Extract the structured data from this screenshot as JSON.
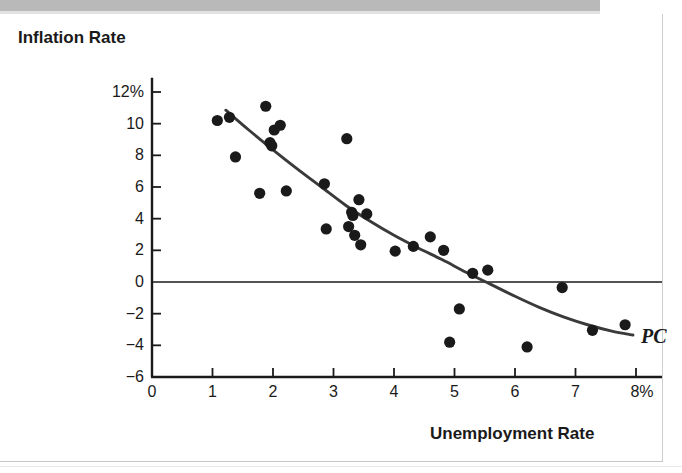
{
  "figure": {
    "y_axis_title": "Inflation Rate",
    "x_axis_title": "Unemployment Rate",
    "curve_label": "PC"
  },
  "chart_data": {
    "type": "scatter",
    "title": "",
    "xlabel": "Unemployment Rate",
    "ylabel": "Inflation Rate",
    "xlim": [
      0,
      8
    ],
    "ylim": [
      -6,
      12
    ],
    "grid": false,
    "legend": "none",
    "x_ticks": [
      "0",
      "1",
      "2",
      "3",
      "4",
      "5",
      "6",
      "7",
      "8%"
    ],
    "x_tick_values": [
      0,
      1,
      2,
      3,
      4,
      5,
      6,
      7,
      8
    ],
    "y_ticks": [
      "12%",
      "10",
      "8",
      "6",
      "4",
      "2",
      "0",
      "−2",
      "−4",
      "−6"
    ],
    "y_tick_values": [
      12,
      10,
      8,
      6,
      4,
      2,
      0,
      -2,
      -4,
      -6
    ],
    "zero_line": 0,
    "point_color": "#1a1a1a",
    "curve_color": "#3a3a3a",
    "axis_color": "#1a1a1a",
    "series": [
      {
        "name": "Inflation vs Unemployment observations",
        "marker": "filled-circle",
        "points": [
          [
            1.08,
            10.2
          ],
          [
            1.28,
            10.4
          ],
          [
            1.38,
            7.9
          ],
          [
            1.78,
            5.6
          ],
          [
            1.88,
            11.1
          ],
          [
            1.95,
            8.8
          ],
          [
            1.98,
            8.6
          ],
          [
            2.02,
            9.6
          ],
          [
            2.12,
            9.9
          ],
          [
            2.22,
            5.75
          ],
          [
            2.85,
            6.2
          ],
          [
            2.88,
            3.35
          ],
          [
            3.22,
            9.05
          ],
          [
            3.25,
            3.5
          ],
          [
            3.3,
            4.4
          ],
          [
            3.32,
            4.2
          ],
          [
            3.35,
            2.95
          ],
          [
            3.42,
            5.2
          ],
          [
            3.45,
            2.35
          ],
          [
            3.55,
            4.3
          ],
          [
            4.02,
            1.95
          ],
          [
            4.32,
            2.25
          ],
          [
            4.6,
            2.85
          ],
          [
            4.82,
            2.0
          ],
          [
            4.92,
            -3.8
          ],
          [
            5.08,
            -1.7
          ],
          [
            5.3,
            0.55
          ],
          [
            5.55,
            0.75
          ],
          [
            6.2,
            -4.1
          ],
          [
            6.78,
            -0.35
          ],
          [
            7.28,
            -3.05
          ],
          [
            7.82,
            -2.7
          ]
        ]
      }
    ],
    "fit_curve": {
      "name": "PC",
      "label": "PC",
      "type": "downward-sloping-convex",
      "points": [
        [
          1.22,
          10.85
        ],
        [
          1.6,
          9.6
        ],
        [
          2.0,
          8.35
        ],
        [
          2.4,
          7.15
        ],
        [
          2.8,
          6.0
        ],
        [
          3.2,
          4.85
        ],
        [
          3.6,
          3.85
        ],
        [
          4.0,
          2.95
        ],
        [
          4.4,
          2.15
        ],
        [
          4.8,
          1.4
        ],
        [
          5.2,
          0.6
        ],
        [
          5.6,
          -0.15
        ],
        [
          6.0,
          -0.9
        ],
        [
          6.4,
          -1.6
        ],
        [
          6.8,
          -2.2
        ],
        [
          7.2,
          -2.7
        ],
        [
          7.6,
          -3.1
        ],
        [
          7.95,
          -3.35
        ]
      ]
    }
  }
}
